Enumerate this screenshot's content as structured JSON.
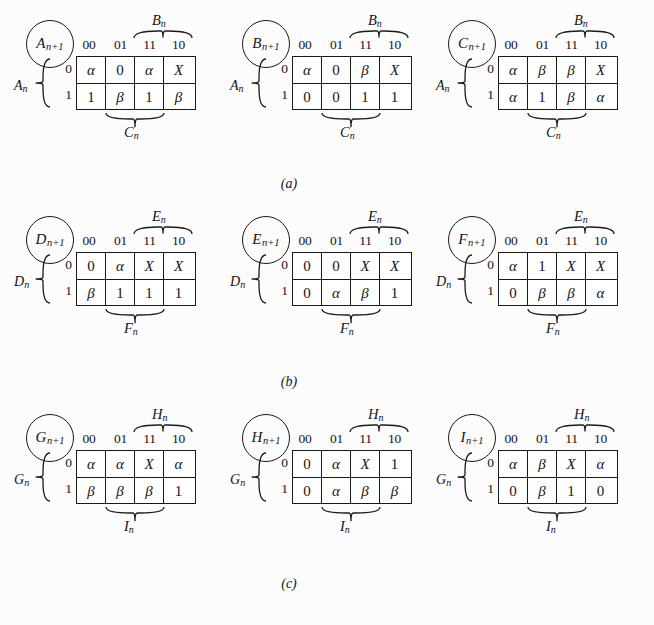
{
  "figure": {
    "background_color": "#fcfcfd",
    "ink_color": "#1a1a1a",
    "title": "",
    "subfigure_captions": [
      "(a)",
      "(b)",
      "(c)"
    ]
  },
  "glyphs": {
    "alpha": "α",
    "beta": "β",
    "dontcare": "X",
    "zero": "0",
    "one": "1"
  },
  "column_headers": [
    "00",
    "01",
    "11",
    "10"
  ],
  "row_headers": [
    "0",
    "1"
  ],
  "rows": [
    {
      "caption": "(a)",
      "maps": [
        {
          "output_label": "A",
          "output_sub": "n+1",
          "top_var": "B",
          "top_sub": "n",
          "left_var": "A",
          "left_sub": "n",
          "bottom_var": "C",
          "bottom_sub": "n",
          "cells": [
            [
              "α",
              "0",
              "α",
              "X"
            ],
            [
              "1",
              "β",
              "1",
              "β"
            ]
          ]
        },
        {
          "output_label": "B",
          "output_sub": "n+1",
          "top_var": "B",
          "top_sub": "n",
          "left_var": "A",
          "left_sub": "n",
          "bottom_var": "C",
          "bottom_sub": "n",
          "cells": [
            [
              "α",
              "0",
              "β",
              "X"
            ],
            [
              "0",
              "0",
              "1",
              "1"
            ]
          ]
        },
        {
          "output_label": "C",
          "output_sub": "n+1",
          "top_var": "B",
          "top_sub": "n",
          "left_var": "A",
          "left_sub": "n",
          "bottom_var": "C",
          "bottom_sub": "n",
          "cells": [
            [
              "α",
              "β",
              "β",
              "X"
            ],
            [
              "α",
              "1",
              "β",
              "α"
            ]
          ]
        }
      ]
    },
    {
      "caption": "(b)",
      "maps": [
        {
          "output_label": "D",
          "output_sub": "n+1",
          "top_var": "E",
          "top_sub": "n",
          "left_var": "D",
          "left_sub": "n",
          "bottom_var": "F",
          "bottom_sub": "n",
          "cells": [
            [
              "0",
              "α",
              "X",
              "X"
            ],
            [
              "β",
              "1",
              "1",
              "1"
            ]
          ]
        },
        {
          "output_label": "E",
          "output_sub": "n+1",
          "top_var": "E",
          "top_sub": "n",
          "left_var": "D",
          "left_sub": "n",
          "bottom_var": "F",
          "bottom_sub": "n",
          "cells": [
            [
              "0",
              "0",
              "X",
              "X"
            ],
            [
              "0",
              "α",
              "β",
              "1"
            ]
          ]
        },
        {
          "output_label": "F",
          "output_sub": "n+1",
          "top_var": "E",
          "top_sub": "n",
          "left_var": "D",
          "left_sub": "n",
          "bottom_var": "F",
          "bottom_sub": "n",
          "cells": [
            [
              "α",
              "1",
              "X",
              "X"
            ],
            [
              "0",
              "β",
              "β",
              "α"
            ]
          ]
        }
      ]
    },
    {
      "caption": "(c)",
      "maps": [
        {
          "output_label": "G",
          "output_sub": "n+1",
          "top_var": "H",
          "top_sub": "n",
          "left_var": "G",
          "left_sub": "n",
          "bottom_var": "I",
          "bottom_sub": "n",
          "cells": [
            [
              "α",
              "α",
              "X",
              "α"
            ],
            [
              "β",
              "β",
              "β",
              "1"
            ]
          ]
        },
        {
          "output_label": "H",
          "output_sub": "n+1",
          "top_var": "H",
          "top_sub": "n",
          "left_var": "G",
          "left_sub": "n",
          "bottom_var": "I",
          "bottom_sub": "n",
          "cells": [
            [
              "0",
              "α",
              "X",
              "1"
            ],
            [
              "0",
              "α",
              "β",
              "β"
            ]
          ]
        },
        {
          "output_label": "I",
          "output_sub": "n+1",
          "top_var": "H",
          "top_sub": "n",
          "left_var": "G",
          "left_sub": "n",
          "bottom_var": "I",
          "bottom_sub": "n",
          "cells": [
            [
              "α",
              "β",
              "X",
              "α"
            ],
            [
              "0",
              "β",
              "1",
              "0"
            ]
          ]
        }
      ]
    }
  ]
}
